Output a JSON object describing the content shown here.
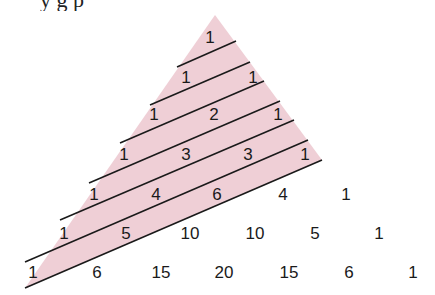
{
  "header": {
    "clipped_caption": "y          g                                p"
  },
  "diagram": {
    "colors": {
      "shade": "#efcfd6",
      "line": "#1a1a1a",
      "text": "#1a1a1a"
    },
    "rows": [
      [
        "1"
      ],
      [
        "1",
        "1"
      ],
      [
        "1",
        "2",
        "1"
      ],
      [
        "1",
        "3",
        "3",
        "1"
      ],
      [
        "1",
        "4",
        "6",
        "4",
        "1"
      ],
      [
        "1",
        "5",
        "10",
        "10",
        "5",
        "1"
      ],
      [
        "1",
        "6",
        "15",
        "20",
        "15",
        "6",
        "1"
      ]
    ],
    "shaded_region": {
      "apex": [
        215,
        15
      ],
      "bottom_left": [
        25,
        288
      ],
      "right_corner": [
        322,
        160
      ]
    },
    "diagonal_lines": [
      {
        "x1": 177,
        "y1": 67,
        "x2": 236,
        "y2": 41
      },
      {
        "x1": 150,
        "y1": 105,
        "x2": 250,
        "y2": 62
      },
      {
        "x1": 120,
        "y1": 143,
        "x2": 264,
        "y2": 81
      },
      {
        "x1": 89,
        "y1": 183,
        "x2": 280,
        "y2": 101
      },
      {
        "x1": 60,
        "y1": 220,
        "x2": 294,
        "y2": 120
      },
      {
        "x1": 25,
        "y1": 262,
        "x2": 308,
        "y2": 140
      },
      {
        "x1": 25,
        "y1": 288,
        "x2": 322,
        "y2": 160
      }
    ],
    "row_layout": [
      {
        "y": 43,
        "x": [
          210
        ]
      },
      {
        "y": 83,
        "x": [
          186,
          253
        ]
      },
      {
        "y": 120,
        "x": [
          154,
          214,
          278
        ]
      },
      {
        "y": 160,
        "x": [
          124,
          186,
          248,
          305
        ]
      },
      {
        "y": 200,
        "x": [
          94,
          156,
          217,
          283,
          346
        ]
      },
      {
        "y": 239,
        "x": [
          64,
          126,
          190,
          255,
          315,
          379
        ]
      },
      {
        "y": 278,
        "x": [
          33,
          97,
          161,
          224,
          289,
          349,
          413
        ]
      }
    ]
  }
}
